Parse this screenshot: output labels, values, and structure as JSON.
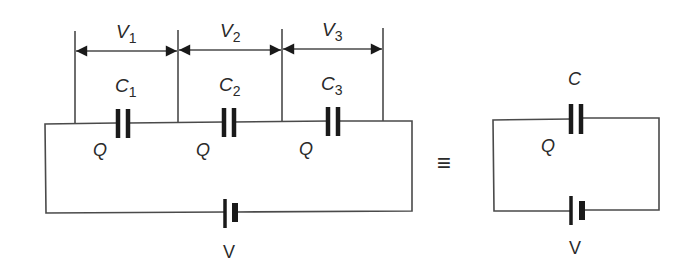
{
  "diagram": {
    "series_circuit": {
      "voltage_labels": [
        {
          "symbol": "V",
          "subscript": "1"
        },
        {
          "symbol": "V",
          "subscript": "2"
        },
        {
          "symbol": "V",
          "subscript": "3"
        }
      ],
      "capacitor_labels": [
        {
          "symbol": "C",
          "subscript": "1"
        },
        {
          "symbol": "C",
          "subscript": "2"
        },
        {
          "symbol": "C",
          "subscript": "3"
        }
      ],
      "charge_labels": [
        "Q",
        "Q",
        "Q"
      ],
      "battery_label": "V"
    },
    "equivalence_symbol": "≡",
    "equivalent_circuit": {
      "capacitor_label": "C",
      "charge_label": "Q",
      "battery_label": "V"
    },
    "colors": {
      "wire": "#4a4a4a",
      "plate": "#1a1a1a",
      "text": "#2a2a2a",
      "background": "#ffffff"
    }
  }
}
